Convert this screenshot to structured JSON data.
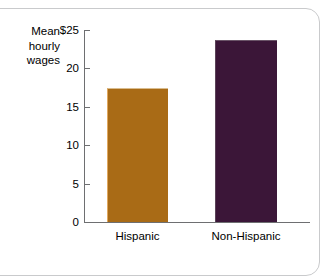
{
  "chart_data": {
    "type": "bar",
    "title": "",
    "subtitle": "",
    "ylabel": "Mean hourly wages",
    "ylabel_lines": [
      "Mean",
      "hourly",
      "wages"
    ],
    "xlabel": "",
    "categories": [
      "Hispanic",
      "Non-Hispanic"
    ],
    "values": [
      17.4,
      23.7
    ],
    "series": [
      {
        "name": "Mean hourly wages",
        "values": [
          17.4,
          23.7
        ]
      }
    ],
    "ylim": [
      0,
      25
    ],
    "y_ticks": [
      0,
      5,
      10,
      15,
      20,
      25
    ],
    "y_tick_labels": [
      "0",
      "5",
      "10",
      "15",
      "20",
      "$25"
    ],
    "grid": false,
    "legend": "none",
    "bar_colors": [
      "#a96b16",
      "#3b1638"
    ],
    "annotations": []
  },
  "figure": {
    "frame_color": "#c9cacc",
    "axis_color": "#6e6f71",
    "background": "#ffffff",
    "text_color": "#000000"
  }
}
